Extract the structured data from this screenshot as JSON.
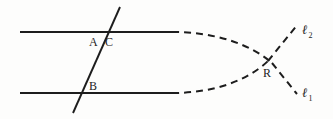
{
  "figure": {
    "kind": "geometry-diagram",
    "background_color": "#fdfdfc",
    "ink_color": "#1d1d1d",
    "width": 333,
    "height": 119
  },
  "labels": {
    "point_a": "A",
    "point_b": "B",
    "point_c": "C",
    "point_r": "R",
    "ray_one_letter": "ℓ",
    "ray_one_sub": "1",
    "ray_two_letter": "ℓ",
    "ray_two_sub": "2"
  },
  "geometry": {
    "top_line_solid": {
      "x1": 20,
      "y1": 32,
      "x2": 172,
      "y2": 32
    },
    "bottom_line_solid": {
      "x1": 20,
      "y1": 93,
      "x2": 172,
      "y2": 93
    },
    "transversal": {
      "x1": 120,
      "y1": 7,
      "x2": 73,
      "y2": 113
    },
    "top_dashed_curve": "M 172 32 C 215 32 250 44 272 63",
    "bottom_dashed_curve": "M 172 93 C 215 93 248 80 268 61",
    "upper_right_ray": "M 268 61 L 298 24",
    "lower_right_ray": "M 272 63 L 297 94",
    "dash_pattern": "7,5",
    "stroke_width_solid": 2.1,
    "stroke_width_dashed": 2.0,
    "stroke_width_transversal": 1.9
  },
  "label_positions": {
    "point_a": {
      "left": 89,
      "top": 36
    },
    "point_c": {
      "left": 105,
      "top": 36
    },
    "point_b": {
      "left": 89,
      "top": 80
    },
    "point_r": {
      "left": 263,
      "top": 67
    },
    "ray_two": {
      "left": 302,
      "top": 23
    },
    "ray_one": {
      "left": 302,
      "top": 86
    }
  }
}
